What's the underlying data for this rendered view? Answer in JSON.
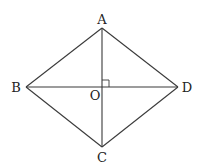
{
  "diagram": {
    "type": "rhombus-with-diagonals",
    "stroke_color": "#3a3a3a",
    "label_color": "#222222",
    "vertices": {
      "A": {
        "label": "A",
        "x": 102,
        "y": 28,
        "label_x": 102,
        "label_y": 24
      },
      "B": {
        "label": "B",
        "x": 26,
        "y": 87,
        "label_x": 16,
        "label_y": 92
      },
      "C": {
        "label": "C",
        "x": 102,
        "y": 147,
        "label_x": 102,
        "label_y": 162
      },
      "D": {
        "label": "D",
        "x": 178,
        "y": 87,
        "label_x": 187,
        "label_y": 92
      }
    },
    "center": {
      "label": "O",
      "x": 102,
      "y": 87,
      "label_x": 95,
      "label_y": 100
    },
    "edges": [
      [
        "A",
        "B"
      ],
      [
        "B",
        "C"
      ],
      [
        "C",
        "D"
      ],
      [
        "D",
        "A"
      ]
    ],
    "diagonals": [
      [
        "A",
        "C"
      ],
      [
        "B",
        "D"
      ]
    ],
    "right_angle_marker": {
      "at": "O",
      "size": 7,
      "quadrant": "upper-right"
    }
  }
}
